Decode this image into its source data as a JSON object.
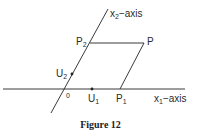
{
  "figure": {
    "caption": "Figure 12",
    "axes": {
      "x1": {
        "label_base": "x",
        "label_sub": "1",
        "label_suffix": "−axis"
      },
      "x2": {
        "label_base": "x",
        "label_sub": "2",
        "label_suffix": "−axis"
      }
    },
    "points": {
      "origin": {
        "label": "0"
      },
      "P": {
        "label": "P"
      },
      "P1": {
        "label_base": "P",
        "label_sub": "1"
      },
      "P2": {
        "label_base": "P",
        "label_sub": "2"
      },
      "U1": {
        "label_base": "U",
        "label_sub": "1"
      },
      "U2": {
        "label_base": "U",
        "label_sub": "2"
      }
    },
    "colors": {
      "line": "#3a3a3a",
      "background": "#ffffff"
    }
  }
}
